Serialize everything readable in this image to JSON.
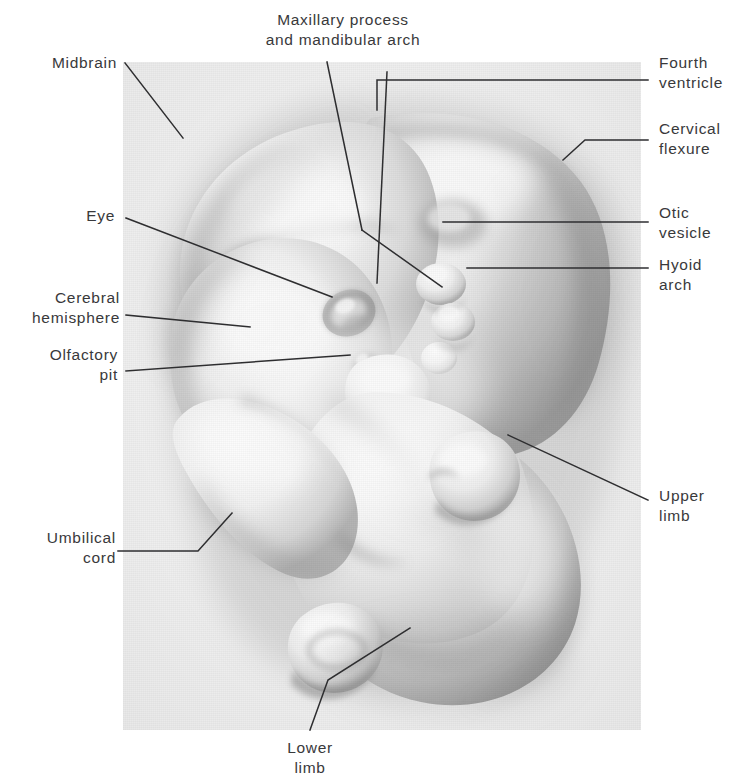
{
  "figure": {
    "kind": "anatomical-photograph",
    "plate_background": "#efefef",
    "label_color": "#39393b",
    "leader_color": "#2e2e30"
  },
  "labels": [
    {
      "id": "maxillary-process",
      "text": "Maxillary process\nand mandibular arch",
      "align": "c",
      "x": 343,
      "y": 10,
      "w": 240
    },
    {
      "id": "midbrain",
      "text": "Midbrain",
      "align": "r",
      "x": 117,
      "y": 53,
      "w": 200
    },
    {
      "id": "fourth-ventricle",
      "text": "Fourth\nventricle",
      "align": "l",
      "x": 659,
      "y": 53,
      "w": 90
    },
    {
      "id": "cervical-flexure",
      "text": "Cervical\nflexure",
      "align": "l",
      "x": 659,
      "y": 119,
      "w": 90
    },
    {
      "id": "eye",
      "text": "Eye",
      "align": "r",
      "x": 115,
      "y": 206,
      "w": 110
    },
    {
      "id": "otic-vesicle",
      "text": "Otic\nvesicle",
      "align": "l",
      "x": 659,
      "y": 203,
      "w": 90
    },
    {
      "id": "hyoid-arch",
      "text": "Hyoid\narch",
      "align": "l",
      "x": 659,
      "y": 255,
      "w": 90
    },
    {
      "id": "cerebral-hemisphere",
      "text": "Cerebral\nhemisphere",
      "align": "r",
      "x": 120,
      "y": 288,
      "w": 180
    },
    {
      "id": "olfactory-pit",
      "text": "Olfactory\npit",
      "align": "r",
      "x": 118,
      "y": 345,
      "w": 150
    },
    {
      "id": "upper-limb",
      "text": "Upper\nlimb",
      "align": "l",
      "x": 659,
      "y": 486,
      "w": 90
    },
    {
      "id": "umbilical-cord",
      "text": "Umbilical\ncord",
      "align": "r",
      "x": 116,
      "y": 528,
      "w": 150
    },
    {
      "id": "lower-limb",
      "text": "Lower\nlimb",
      "align": "c",
      "x": 310,
      "y": 738,
      "w": 120
    }
  ],
  "leaders": [
    {
      "id": "leader-midbrain",
      "points": "125,63 183,138"
    },
    {
      "id": "leader-maxillary-a",
      "points": "327,62 362,230"
    },
    {
      "id": "leader-maxillary-b",
      "points": "362,230 442,287"
    },
    {
      "id": "leader-mandibular",
      "points": "387,72 377,283"
    },
    {
      "id": "leader-fourth-ventricle",
      "points": "648,80 377,80 377,110"
    },
    {
      "id": "leader-cervical-flexure",
      "points": "648,140 585,140 563,160"
    },
    {
      "id": "leader-eye",
      "points": "126,218 332,297"
    },
    {
      "id": "leader-otic-vesicle",
      "points": "648,222 443,222"
    },
    {
      "id": "leader-hyoid-arch",
      "points": "648,268 467,268"
    },
    {
      "id": "leader-cerebral-hemisphere",
      "points": "126,315 250,327"
    },
    {
      "id": "leader-olfactory-pit",
      "points": "126,371 350,355"
    },
    {
      "id": "leader-upper-limb",
      "points": "648,500 508,435"
    },
    {
      "id": "leader-umbilical-cord",
      "points": "118,551 198,551 232,513"
    },
    {
      "id": "leader-lower-limb",
      "points": "310,730 328,680 410,628"
    }
  ]
}
